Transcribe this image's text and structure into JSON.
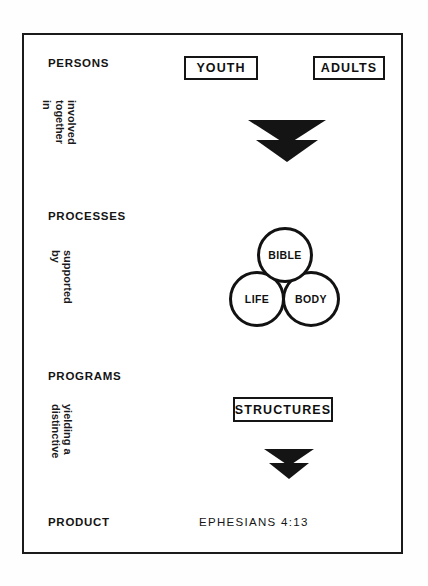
{
  "diagram": {
    "frame_color": "#1b1b1b",
    "background_color": "#ffffff",
    "stages": [
      {
        "id": "persons",
        "label": "PERSONS"
      },
      {
        "id": "processes",
        "label": "PROCESSES"
      },
      {
        "id": "programs",
        "label": "PROGRAMS"
      },
      {
        "id": "product",
        "label": "PRODUCT"
      }
    ],
    "connectors": [
      {
        "id": "involved-together-in",
        "line1": "involved",
        "line2": "together",
        "line3": "in"
      },
      {
        "id": "supported-by",
        "line1": "supported",
        "line2": "by"
      },
      {
        "id": "yielding-a-distinctive",
        "line1": "yielding a",
        "line2": "distinctive"
      }
    ],
    "boxes": [
      {
        "id": "youth",
        "label": "YOUTH"
      },
      {
        "id": "adults",
        "label": "ADULTS"
      },
      {
        "id": "structures",
        "label": "STRUCTURES"
      }
    ],
    "circles": [
      {
        "id": "bible",
        "label": "BIBLE"
      },
      {
        "id": "life",
        "label": "LIFE"
      },
      {
        "id": "body",
        "label": "BODY"
      }
    ],
    "arrows": [
      {
        "id": "arrow-persons-to-processes",
        "icon": "double-chevron-down-icon",
        "size": "large"
      },
      {
        "id": "arrow-programs-to-product",
        "icon": "double-chevron-down-icon",
        "size": "small"
      }
    ],
    "scripture_reference": "EPHESIANS  4:13"
  }
}
